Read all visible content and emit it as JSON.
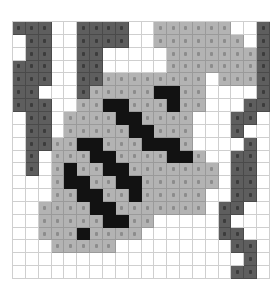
{
  "puzzle": {
    "rows": 20,
    "cols": 20,
    "legend": {
      "0": "white",
      "1": "light-gray",
      "2": "dark-gray",
      "3": "black"
    },
    "palette": {
      "0": "#ffffff",
      "1": "#b3b3b3",
      "2": "#5e5e5e",
      "3": "#121212"
    },
    "grid": [
      [
        2,
        2,
        2,
        0,
        0,
        2,
        2,
        2,
        2,
        0,
        0,
        1,
        1,
        1,
        1,
        1,
        1,
        0,
        0,
        2
      ],
      [
        0,
        2,
        2,
        0,
        0,
        2,
        2,
        2,
        2,
        0,
        0,
        1,
        1,
        1,
        1,
        1,
        1,
        1,
        0,
        2
      ],
      [
        0,
        2,
        2,
        0,
        0,
        2,
        2,
        0,
        0,
        0,
        0,
        0,
        1,
        1,
        1,
        1,
        1,
        1,
        1,
        2
      ],
      [
        2,
        2,
        2,
        0,
        0,
        2,
        2,
        0,
        0,
        0,
        0,
        0,
        1,
        1,
        1,
        1,
        1,
        1,
        1,
        2
      ],
      [
        2,
        2,
        2,
        0,
        0,
        2,
        2,
        1,
        1,
        1,
        1,
        1,
        1,
        1,
        1,
        0,
        1,
        1,
        1,
        2
      ],
      [
        2,
        2,
        0,
        0,
        0,
        2,
        1,
        1,
        1,
        1,
        1,
        3,
        3,
        1,
        1,
        0,
        0,
        0,
        0,
        2
      ],
      [
        2,
        2,
        2,
        0,
        0,
        1,
        1,
        3,
        3,
        1,
        1,
        1,
        3,
        1,
        1,
        0,
        0,
        0,
        2,
        2
      ],
      [
        0,
        2,
        2,
        0,
        1,
        1,
        1,
        1,
        3,
        3,
        1,
        1,
        1,
        1,
        0,
        0,
        0,
        2,
        2,
        0
      ],
      [
        0,
        2,
        2,
        0,
        1,
        1,
        1,
        1,
        1,
        3,
        3,
        1,
        1,
        1,
        0,
        0,
        0,
        2,
        0,
        0
      ],
      [
        0,
        2,
        2,
        1,
        1,
        3,
        3,
        1,
        1,
        1,
        3,
        3,
        3,
        1,
        0,
        0,
        0,
        0,
        2,
        0
      ],
      [
        0,
        2,
        0,
        1,
        1,
        1,
        3,
        3,
        1,
        1,
        1,
        1,
        3,
        3,
        1,
        0,
        0,
        2,
        2,
        0
      ],
      [
        0,
        2,
        0,
        1,
        3,
        1,
        1,
        3,
        3,
        1,
        1,
        1,
        1,
        1,
        1,
        1,
        0,
        2,
        2,
        0
      ],
      [
        0,
        0,
        0,
        1,
        3,
        3,
        1,
        1,
        3,
        3,
        1,
        1,
        1,
        1,
        1,
        1,
        0,
        2,
        2,
        0
      ],
      [
        0,
        0,
        0,
        1,
        1,
        3,
        3,
        1,
        1,
        3,
        1,
        1,
        1,
        1,
        1,
        0,
        0,
        2,
        2,
        0
      ],
      [
        0,
        0,
        1,
        1,
        1,
        1,
        3,
        3,
        1,
        1,
        1,
        1,
        1,
        1,
        1,
        0,
        2,
        2,
        0,
        0
      ],
      [
        0,
        0,
        1,
        1,
        1,
        1,
        1,
        3,
        3,
        1,
        1,
        0,
        0,
        0,
        0,
        0,
        2,
        0,
        0,
        0
      ],
      [
        0,
        0,
        1,
        1,
        1,
        3,
        1,
        1,
        1,
        1,
        0,
        0,
        0,
        0,
        0,
        0,
        2,
        2,
        0,
        0
      ],
      [
        0,
        0,
        0,
        1,
        1,
        1,
        1,
        1,
        0,
        0,
        0,
        0,
        0,
        0,
        0,
        0,
        0,
        2,
        2,
        0
      ],
      [
        0,
        0,
        0,
        0,
        0,
        0,
        0,
        0,
        0,
        0,
        0,
        0,
        0,
        0,
        0,
        0,
        0,
        0,
        2,
        0
      ],
      [
        0,
        0,
        0,
        0,
        0,
        0,
        0,
        0,
        0,
        0,
        0,
        0,
        0,
        0,
        0,
        0,
        0,
        2,
        2,
        0
      ]
    ]
  }
}
